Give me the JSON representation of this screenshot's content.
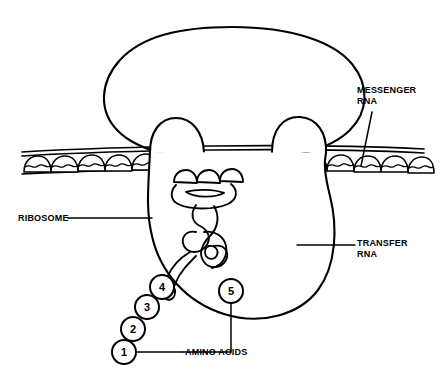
{
  "figure": {
    "type": "biological-schematic",
    "background_color": "#ffffff",
    "line_color": "#000000",
    "shading": "stipple"
  },
  "labels": {
    "messenger_rna": {
      "line1": "MESSENGER",
      "line2": "RNA"
    },
    "transfer_rna": {
      "line1": "TRANSFER",
      "line2": "RNA"
    },
    "ribosome": {
      "line1": "RIBOSOME"
    },
    "amino_acids": {
      "line1": "AMINO ACIDS"
    }
  },
  "amino_acid_chain": {
    "count": 5,
    "numbers": [
      "1",
      "2",
      "3",
      "4",
      "5"
    ],
    "attached_label": "AMINO ACIDS"
  },
  "structures": {
    "large_subunit": "ribosome-upper-lobe",
    "small_subunit": "ribosome-lower-body",
    "mrna_strand": "messenger-rna-strand",
    "trna_molecules": 2
  }
}
